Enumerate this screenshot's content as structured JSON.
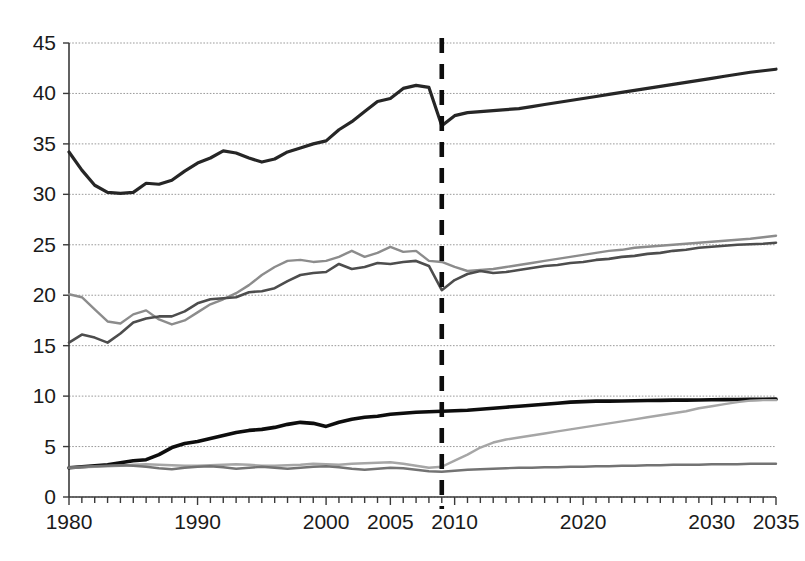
{
  "chart_data": {
    "type": "line",
    "title": "",
    "subtitle": "",
    "xlabel": "",
    "ylabel": "",
    "xlim": [
      1980,
      2035
    ],
    "ylim": [
      0,
      45
    ],
    "y_ticks": [
      0,
      5,
      10,
      15,
      20,
      25,
      30,
      35,
      40,
      45
    ],
    "x_ticks": [
      1980,
      1990,
      2000,
      2005,
      2010,
      2020,
      2030,
      2035
    ],
    "x_minor_tick_step": 1,
    "grid": true,
    "legend": "none",
    "annotations": [
      {
        "name": "forecast-divider",
        "type": "vertical-dashed-line",
        "x": 2009,
        "label": "",
        "color": "#0d0d0d"
      }
    ],
    "x": [
      1980,
      1981,
      1982,
      1983,
      1984,
      1985,
      1986,
      1987,
      1988,
      1989,
      1990,
      1991,
      1992,
      1993,
      1994,
      1995,
      1996,
      1997,
      1998,
      1999,
      2000,
      2001,
      2002,
      2003,
      2004,
      2005,
      2006,
      2007,
      2008,
      2009,
      2010,
      2011,
      2012,
      2013,
      2014,
      2015,
      2016,
      2017,
      2018,
      2019,
      2020,
      2021,
      2022,
      2023,
      2024,
      2025,
      2026,
      2027,
      2028,
      2029,
      2030,
      2031,
      2032,
      2033,
      2034,
      2035
    ],
    "series": [
      {
        "name": "series-top-total",
        "color": "#262626",
        "width": 3.2,
        "values": [
          34.2,
          32.4,
          30.9,
          30.2,
          30.1,
          30.2,
          31.1,
          31.0,
          31.4,
          32.3,
          33.1,
          33.6,
          34.3,
          34.1,
          33.6,
          33.2,
          33.5,
          34.2,
          34.6,
          35.0,
          35.3,
          36.4,
          37.2,
          38.2,
          39.2,
          39.5,
          40.5,
          40.8,
          40.6,
          36.8,
          37.8,
          38.1,
          38.2,
          38.3,
          38.4,
          38.5,
          38.7,
          38.9,
          39.1,
          39.3,
          39.5,
          39.7,
          39.9,
          40.1,
          40.3,
          40.5,
          40.7,
          40.9,
          41.1,
          41.3,
          41.5,
          41.7,
          41.9,
          42.1,
          42.25,
          42.4
        ]
      },
      {
        "name": "series-mid-light",
        "color": "#8c8c8c",
        "width": 2.4,
        "values": [
          20.1,
          19.8,
          18.6,
          17.4,
          17.2,
          18.1,
          18.5,
          17.6,
          17.1,
          17.5,
          18.3,
          19.1,
          19.6,
          20.2,
          21.0,
          22.0,
          22.8,
          23.4,
          23.5,
          23.3,
          23.4,
          23.8,
          24.4,
          23.8,
          24.2,
          24.8,
          24.3,
          24.4,
          23.4,
          23.3,
          22.8,
          22.4,
          22.5,
          22.6,
          22.8,
          23.0,
          23.2,
          23.4,
          23.6,
          23.8,
          24.0,
          24.2,
          24.4,
          24.5,
          24.7,
          24.8,
          24.9,
          25.0,
          25.1,
          25.2,
          25.3,
          25.4,
          25.5,
          25.6,
          25.75,
          25.9
        ]
      },
      {
        "name": "series-mid-dark",
        "color": "#4d4d4d",
        "width": 2.6,
        "values": [
          15.3,
          16.1,
          15.8,
          15.3,
          16.2,
          17.3,
          17.7,
          17.9,
          17.9,
          18.4,
          19.2,
          19.6,
          19.7,
          19.8,
          20.3,
          20.4,
          20.7,
          21.4,
          22.0,
          22.2,
          22.3,
          23.1,
          22.6,
          22.8,
          23.2,
          23.1,
          23.3,
          23.4,
          22.9,
          20.5,
          21.5,
          22.1,
          22.4,
          22.2,
          22.3,
          22.5,
          22.7,
          22.9,
          23.0,
          23.2,
          23.3,
          23.5,
          23.6,
          23.8,
          23.9,
          24.1,
          24.2,
          24.4,
          24.5,
          24.7,
          24.8,
          24.9,
          25.0,
          25.05,
          25.1,
          25.2
        ]
      },
      {
        "name": "series-bottom-black",
        "color": "#0d0d0d",
        "width": 3.6,
        "values": [
          2.9,
          3.0,
          3.1,
          3.2,
          3.4,
          3.6,
          3.7,
          4.2,
          4.9,
          5.3,
          5.5,
          5.8,
          6.1,
          6.4,
          6.6,
          6.7,
          6.9,
          7.2,
          7.4,
          7.3,
          7.0,
          7.4,
          7.7,
          7.9,
          8.0,
          8.2,
          8.3,
          8.4,
          8.45,
          8.5,
          8.55,
          8.6,
          8.7,
          8.8,
          8.9,
          9.0,
          9.1,
          9.2,
          9.3,
          9.4,
          9.45,
          9.5,
          9.5,
          9.52,
          9.54,
          9.56,
          9.58,
          9.6,
          9.6,
          9.62,
          9.64,
          9.65,
          9.66,
          9.68,
          9.69,
          9.7
        ]
      },
      {
        "name": "series-bottom-rising-light",
        "color": "#a6a6a6",
        "width": 2.4,
        "values": [
          2.9,
          2.95,
          3.0,
          3.05,
          3.1,
          3.2,
          3.25,
          3.2,
          3.15,
          3.1,
          3.1,
          3.15,
          3.2,
          3.25,
          3.2,
          3.1,
          3.1,
          3.15,
          3.2,
          3.3,
          3.25,
          3.2,
          3.3,
          3.35,
          3.4,
          3.45,
          3.3,
          3.1,
          2.9,
          3.0,
          3.6,
          4.2,
          4.9,
          5.4,
          5.7,
          5.9,
          6.1,
          6.3,
          6.5,
          6.7,
          6.9,
          7.1,
          7.3,
          7.5,
          7.7,
          7.9,
          8.1,
          8.3,
          8.5,
          8.8,
          9.0,
          9.2,
          9.4,
          9.55,
          9.6,
          9.6
        ]
      },
      {
        "name": "series-bottom-flat-gray",
        "color": "#737373",
        "width": 2.4,
        "values": [
          2.9,
          3.0,
          3.05,
          3.1,
          3.15,
          3.1,
          3.0,
          2.85,
          2.75,
          2.9,
          3.0,
          3.05,
          2.95,
          2.8,
          2.9,
          3.0,
          2.9,
          2.8,
          2.9,
          3.0,
          3.05,
          2.95,
          2.8,
          2.7,
          2.8,
          2.9,
          2.85,
          2.7,
          2.55,
          2.5,
          2.6,
          2.7,
          2.75,
          2.8,
          2.85,
          2.9,
          2.9,
          2.95,
          2.95,
          3.0,
          3.0,
          3.05,
          3.05,
          3.1,
          3.1,
          3.15,
          3.15,
          3.2,
          3.2,
          3.2,
          3.25,
          3.25,
          3.25,
          3.3,
          3.3,
          3.3
        ]
      }
    ]
  },
  "axes": {
    "y_tick_labels": [
      "0",
      "5",
      "10",
      "15",
      "20",
      "25",
      "30",
      "35",
      "40",
      "45"
    ],
    "x_tick_labels": [
      "1980",
      "1990",
      "2000",
      "2005",
      "2010",
      "2020",
      "2030",
      "2035"
    ]
  },
  "colors": {
    "background": "#ffffff",
    "grid": "#9a9a9a",
    "axis": "#3a3a3a",
    "text": "#1a1a1a"
  }
}
